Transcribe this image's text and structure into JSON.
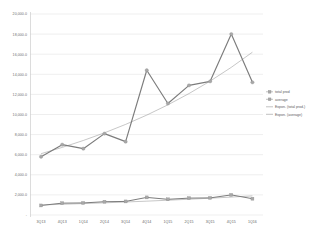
{
  "chart_data": {
    "type": "line",
    "title": "",
    "xlabel": "",
    "ylabel": "",
    "ylim": [
      0,
      20000
    ],
    "grid": true,
    "legend_position": "right",
    "categories": [
      "3Q13",
      "4Q13",
      "1Q14",
      "2Q14",
      "3Q14",
      "4Q14",
      "1Q15",
      "2Q15",
      "3Q15",
      "4Q15",
      "1Q16"
    ],
    "ytick_labels": [
      "20,000.0",
      "18,000.0",
      "16,000.0",
      "14,000.0",
      "12,000.0",
      "10,000.0",
      "8,000.0",
      "6,000.0",
      "4,000.0",
      "2,000.0",
      "-"
    ],
    "ytick_values": [
      20000,
      18000,
      16000,
      14000,
      12000,
      10000,
      8000,
      6000,
      4000,
      2000,
      0
    ],
    "series": [
      {
        "name": "total prod",
        "marker": "circle",
        "values": [
          5800,
          7000,
          6600,
          8100,
          7300,
          14400,
          11100,
          12900,
          13300,
          18000,
          13200
        ]
      },
      {
        "name": "average",
        "marker": "square",
        "values": [
          950,
          1180,
          1200,
          1320,
          1350,
          1750,
          1560,
          1680,
          1700,
          2000,
          1620
        ]
      }
    ],
    "trendlines": [
      {
        "name": "Expon. (total prod.)",
        "of_series": "total prod",
        "start_value": 6100,
        "end_value": 16200
      },
      {
        "name": "Expon. (average)",
        "of_series": "average",
        "start_value": 1000,
        "end_value": 1900
      }
    ]
  },
  "legend": {
    "entries": [
      {
        "label": "total prod",
        "kind": "marker"
      },
      {
        "label": "average",
        "kind": "marker"
      },
      {
        "label": "Expon. (total prod.)",
        "kind": "line"
      },
      {
        "label": "Expon. (average)",
        "kind": "line"
      }
    ]
  }
}
